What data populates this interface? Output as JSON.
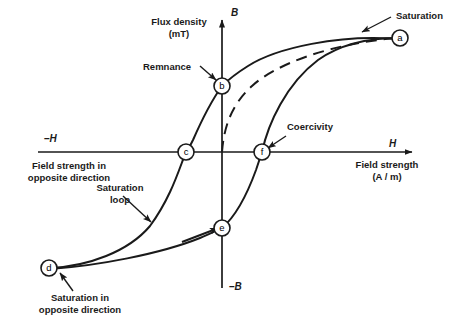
{
  "figure": {
    "type": "hysteresis-loop-diagram",
    "background": "#ffffff",
    "stroke_color": "#1a1a1a"
  },
  "axes": {
    "vertical": {
      "name": "B",
      "symbol": "B",
      "title_line1": "Flux density",
      "title_line2": "(mT)",
      "negative_symbol": "–B",
      "unit": "mT"
    },
    "horizontal": {
      "name": "H",
      "symbol": "H",
      "title_line1": "Field strength",
      "title_line2": "(A / m)",
      "negative_symbol": "–H",
      "unit": "A / m"
    }
  },
  "points": [
    {
      "id": "a",
      "label": "a",
      "x": 400,
      "y": 38,
      "meaning": "Saturation"
    },
    {
      "id": "b",
      "label": "b",
      "x": 222,
      "y": 86,
      "meaning": "Remnance"
    },
    {
      "id": "c",
      "label": "c",
      "x": 186,
      "y": 152,
      "meaning": "Coercivity in opposite direction"
    },
    {
      "id": "d",
      "label": "d",
      "x": 49,
      "y": 268,
      "meaning": "Saturation in opposite direction"
    },
    {
      "id": "e",
      "label": "e",
      "x": 222,
      "y": 228,
      "meaning": "Remnance in opposite direction"
    },
    {
      "id": "f",
      "label": "f",
      "x": 262,
      "y": 152,
      "meaning": "Coercivity"
    }
  ],
  "annotations": [
    {
      "id": "saturation",
      "text": "Saturation",
      "lines": [
        "Saturation"
      ]
    },
    {
      "id": "remnance",
      "text": "Remnance",
      "lines": [
        "Remnance"
      ]
    },
    {
      "id": "coercivity",
      "text": "Coercivity",
      "lines": [
        "Coercivity"
      ]
    },
    {
      "id": "field-strength-opp",
      "text": "Field strength in opposite direction",
      "lines": [
        "Field strength in",
        "opposite direction"
      ]
    },
    {
      "id": "saturation-loop",
      "text": "Saturation loop",
      "lines": [
        "Saturation",
        "loop"
      ]
    },
    {
      "id": "saturation-opp",
      "text": "Saturation in opposite direction",
      "lines": [
        "Saturation in",
        "opposite direction"
      ]
    }
  ],
  "curves": [
    {
      "id": "initial-magnetisation-curve",
      "style": "dashed",
      "from": "origin",
      "to": "a"
    },
    {
      "id": "upper-branch",
      "style": "solid",
      "from": "a",
      "through": [
        "b",
        "c"
      ],
      "to": "d"
    },
    {
      "id": "lower-branch",
      "style": "solid",
      "from": "d",
      "through": [
        "e",
        "f"
      ],
      "to": "a"
    }
  ]
}
